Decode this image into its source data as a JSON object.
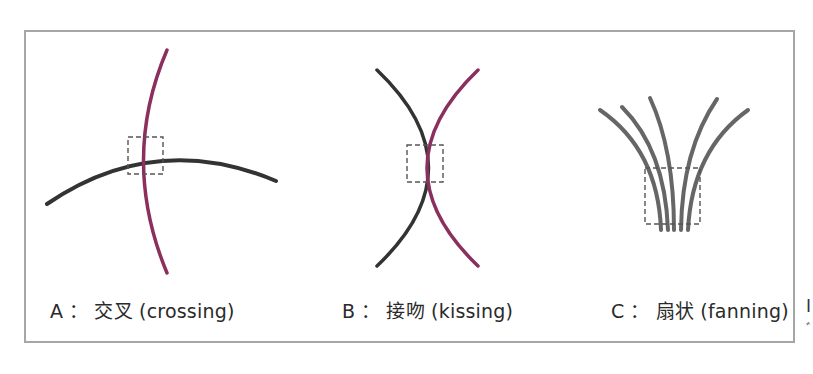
{
  "figure": {
    "panels": [
      {
        "id": "A",
        "letter": "A",
        "name_zh": "交叉",
        "name_en": "(crossing)",
        "description": "Two curves cross at one point",
        "curves": [
          {
            "color": "#8b2f5f",
            "role": "crossing-curve-magenta"
          },
          {
            "color": "#333333",
            "role": "crossing-curve-dark"
          }
        ]
      },
      {
        "id": "B",
        "letter": "B",
        "name_zh": "接吻",
        "name_en": "(kissing)",
        "description": "Two curves touch tangentially",
        "curves": [
          {
            "color": "#333333",
            "role": "kissing-curve-dark"
          },
          {
            "color": "#8b2f5f",
            "role": "kissing-curve-magenta"
          }
        ]
      },
      {
        "id": "C",
        "letter": "C",
        "name_zh": "扇状",
        "name_en": "(fanning)",
        "description": "Five curves converge into a bundle",
        "curve_count": 5,
        "curves": [
          {
            "color": "#666666",
            "role": "fanning-curve"
          }
        ]
      }
    ],
    "separator": "：",
    "clipped_right_text": [
      "I",
      "ﾞ"
    ],
    "colors": {
      "frame": "#a6a6a6",
      "dark_curve": "#333333",
      "magenta_curve": "#8b2f5f",
      "fan_curve": "#666666",
      "dashed_box": "#555555"
    }
  }
}
